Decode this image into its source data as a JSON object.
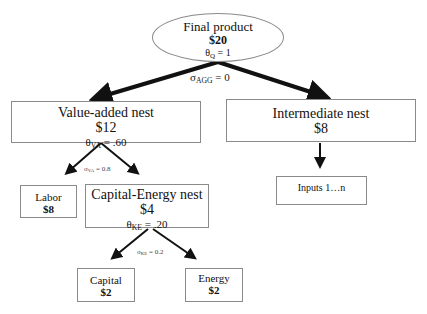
{
  "diagram": {
    "nodes": {
      "final": {
        "title": "Final product",
        "value": "$20",
        "theta_sym": "θ",
        "theta_sub": "Q",
        "theta_val": " = 1"
      },
      "value_added": {
        "title": "Value-added nest",
        "value": "$12",
        "theta_sym": "θ",
        "theta_sub": "VA",
        "theta_val": " = .60"
      },
      "intermediate": {
        "title": "Intermediate nest",
        "value": "$8"
      },
      "labor": {
        "title": "Labor",
        "value": "$8"
      },
      "capital_energy": {
        "title": "Capital-Energy nest",
        "value": "$4",
        "theta_sym": "θ",
        "theta_sub": "KE",
        "theta_val": " = .20"
      },
      "inputs": {
        "title": "Inputs 1…n"
      },
      "capital": {
        "title": "Capital",
        "value": "$2"
      },
      "energy": {
        "title": "Energy",
        "value": "$2"
      }
    },
    "elasticities": {
      "agg": {
        "sym": "σ",
        "sub": "AGG",
        "val": " = 0"
      },
      "va": {
        "sym": "σ",
        "sub": "VA",
        "val": " = 0.8"
      },
      "ke": {
        "sym": "σ",
        "sub": "KE",
        "val": " = 0.2"
      }
    },
    "colors": {
      "border": "#8a8a8a",
      "arrow": "#111111"
    }
  }
}
